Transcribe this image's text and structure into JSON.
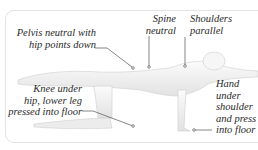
{
  "callouts": {
    "pelvis": "Pelvis neutral with\nhip points down",
    "spine": "Spine\nneutral",
    "shoulders": "Shoulders\nparallel",
    "knee": "Knee under\nhip, lower leg\npressed into floor",
    "hand": "Hand\nunder\nshoulder\nand press\ninto floor"
  },
  "colors": {
    "text": "#2a2a2a",
    "leader": "#555555",
    "body_fill": "#f4f4f4",
    "body_shade": "#d8d8d8",
    "frame": "#e3e3e3"
  }
}
